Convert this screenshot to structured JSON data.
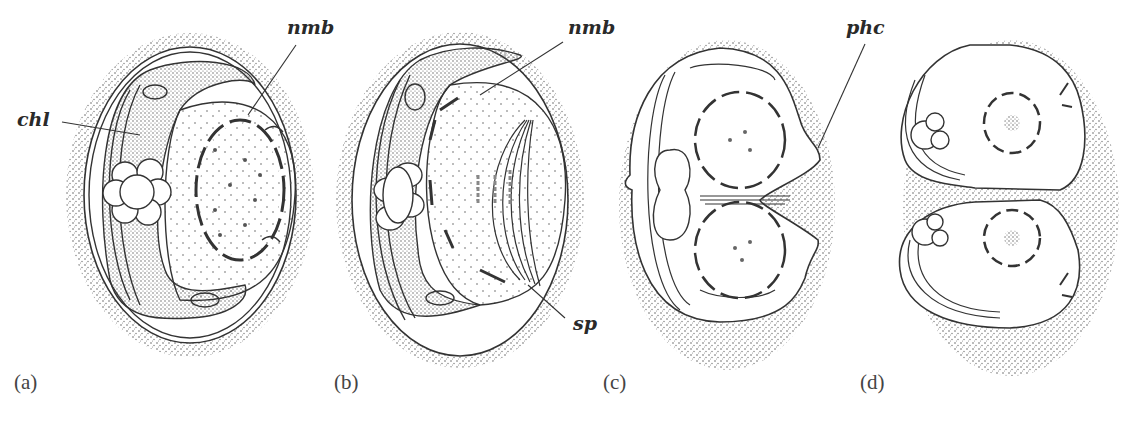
{
  "figure": {
    "panels": [
      {
        "id": "a",
        "label": "(a)"
      },
      {
        "id": "b",
        "label": "(b)"
      },
      {
        "id": "c",
        "label": "(c)"
      },
      {
        "id": "d",
        "label": "(d)"
      }
    ],
    "annotations": {
      "chl": "chl",
      "nmb_a": "nmb",
      "nmb_b": "nmb",
      "sp": "sp",
      "phc": "phc"
    }
  }
}
